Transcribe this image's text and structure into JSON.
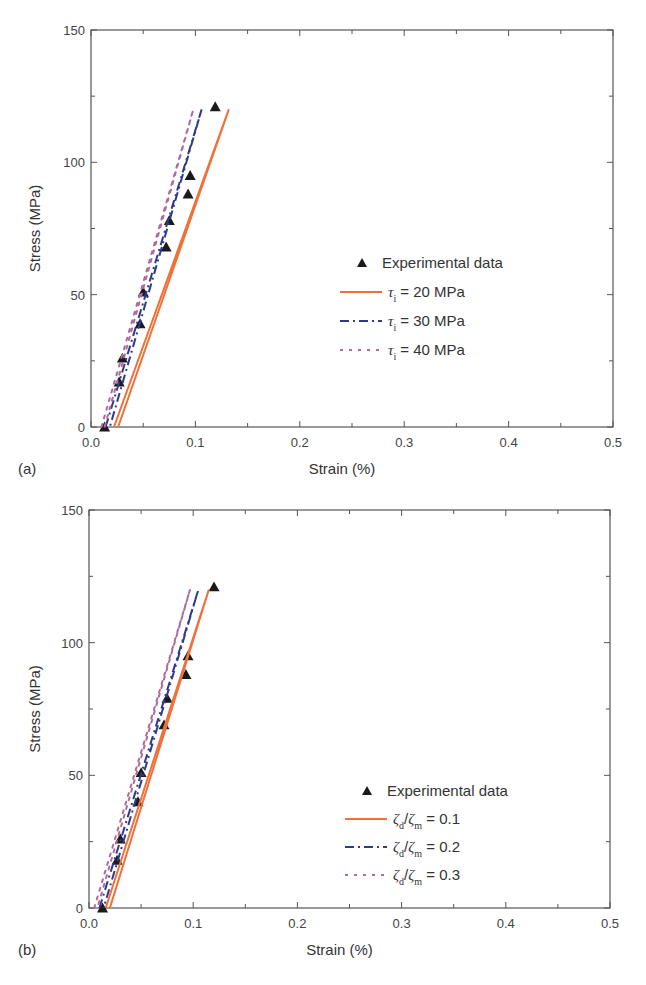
{
  "colors": {
    "orange": "#f0703a",
    "blue": "#2e3a8c",
    "pink": "#b06a9c",
    "marker": "#1a1a1a",
    "axis": "#555555"
  },
  "chart_data": [
    {
      "panel": "(a)",
      "type": "line",
      "xlabel": "Strain (%)",
      "ylabel": "Stress (MPa)",
      "xlim": [
        0.0,
        0.5
      ],
      "ylim": [
        0,
        150
      ],
      "xticks": [
        "0.0",
        "0.1",
        "0.2",
        "0.3",
        "0.4",
        "0.5"
      ],
      "yticks": [
        "0",
        "50",
        "100",
        "150"
      ],
      "grid": false,
      "legend_position": "center-right",
      "series": [
        {
          "name": "Experimental data",
          "style": "triangle-markers",
          "x": [
            0.013,
            0.027,
            0.03,
            0.047,
            0.05,
            0.072,
            0.075,
            0.093,
            0.095,
            0.119
          ],
          "y": [
            0,
            17,
            26,
            39,
            51,
            68,
            78,
            88,
            95,
            121
          ]
        },
        {
          "name": "τi = 20 MPa",
          "symbol": "τ",
          "sub": "i",
          "suffix": " = 20 MPa",
          "style": "solid",
          "color": "#f0703a",
          "x": [
            0.022,
            0.132,
            0.026
          ],
          "y": [
            0,
            120,
            0
          ]
        },
        {
          "name": "τi = 30 MPa",
          "symbol": "τ",
          "sub": "i",
          "suffix": " = 30 MPa",
          "style": "dash-dot",
          "color": "#2e3a8c",
          "x": [
            0.014,
            0.106,
            0.018
          ],
          "y": [
            0,
            120,
            0
          ]
        },
        {
          "name": "τi = 40 MPa",
          "symbol": "τ",
          "sub": "i",
          "suffix": " = 40 MPa",
          "style": "dotted",
          "color": "#b06a9c",
          "x": [
            0.01,
            0.098,
            0.013
          ],
          "y": [
            0,
            120,
            0
          ]
        }
      ]
    },
    {
      "panel": "(b)",
      "type": "line",
      "xlabel": "Strain (%)",
      "ylabel": "Stress (MPa)",
      "xlim": [
        0.0,
        0.5
      ],
      "ylim": [
        0,
        150
      ],
      "xticks": [
        "0.0",
        "0.1",
        "0.2",
        "0.3",
        "0.4",
        "0.5"
      ],
      "yticks": [
        "0",
        "50",
        "100",
        "150"
      ],
      "grid": false,
      "legend_position": "lower-right",
      "series": [
        {
          "name": "Experimental data",
          "style": "triangle-markers",
          "x": [
            0.013,
            0.027,
            0.03,
            0.047,
            0.05,
            0.072,
            0.075,
            0.093,
            0.095,
            0.12
          ],
          "y": [
            0,
            18,
            26,
            40,
            51,
            69,
            79,
            88,
            95,
            121
          ]
        },
        {
          "name": "ζd/ζm = 0.1",
          "symbol": "ζ",
          "sub": "d",
          "symbol2": "ζ",
          "sub2": "m",
          "suffix": " = 0.1",
          "style": "solid",
          "color": "#f0703a",
          "x": [
            0.016,
            0.115,
            0.02
          ],
          "y": [
            0,
            120,
            0
          ]
        },
        {
          "name": "ζd/ζm = 0.2",
          "symbol": "ζ",
          "sub": "d",
          "symbol2": "ζ",
          "sub2": "m",
          "suffix": " = 0.2",
          "style": "dash-dot",
          "color": "#2e3a8c",
          "x": [
            0.01,
            0.105,
            0.014
          ],
          "y": [
            0,
            120,
            0
          ]
        },
        {
          "name": "ζd/ζm = 0.3",
          "symbol": "ζ",
          "sub": "d",
          "symbol2": "ζ",
          "sub2": "m",
          "suffix": " = 0.3",
          "style": "dotted",
          "color": "#b06a9c",
          "x": [
            0.005,
            0.097,
            0.008
          ],
          "y": [
            0,
            120,
            0
          ]
        }
      ]
    }
  ]
}
